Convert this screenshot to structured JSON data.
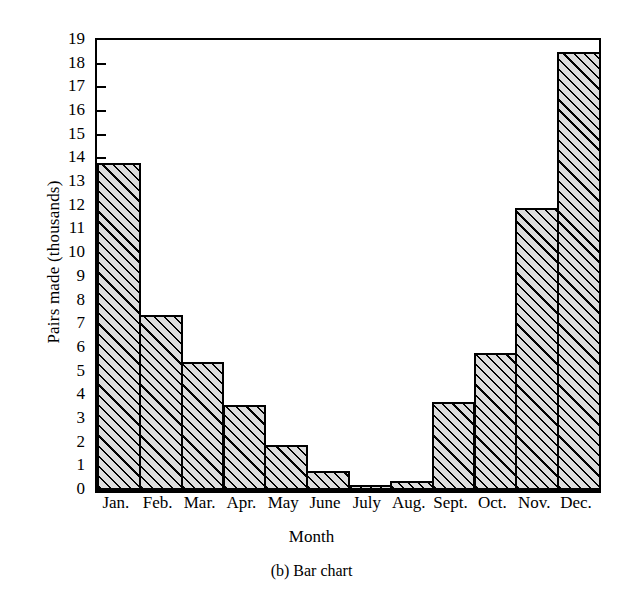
{
  "figure": {
    "caption": "(b)  Bar chart"
  },
  "chart_data": {
    "type": "bar",
    "title": "",
    "xlabel": "Month",
    "ylabel": "Pairs made (thousands)",
    "categories": [
      "Jan.",
      "Feb.",
      "Mar.",
      "Apr.",
      "May",
      "June",
      "July",
      "Aug.",
      "Sept.",
      "Oct.",
      "Nov.",
      "Dec."
    ],
    "values": [
      13.8,
      7.4,
      5.4,
      3.6,
      1.9,
      0.8,
      0.2,
      0.4,
      3.7,
      5.8,
      11.9,
      18.5
    ],
    "ylim": [
      0,
      19
    ],
    "yticks": [
      0,
      1,
      2,
      3,
      4,
      5,
      6,
      7,
      8,
      9,
      10,
      11,
      12,
      13,
      14,
      15,
      16,
      17,
      18,
      19
    ],
    "ytick_labels": [
      "0",
      "1",
      "2",
      "3",
      "4",
      "5",
      "6",
      "7",
      "8",
      "9",
      "10",
      "11",
      "12",
      "13",
      "14",
      "15",
      "16",
      "17",
      "18",
      "19"
    ],
    "grid": false,
    "legend": null,
    "bar_gap": 0,
    "bar_fill": "#dcdcdc",
    "bar_hatch": "diagonal-45",
    "bar_edge_color": "#000000",
    "axis_color": "#000000",
    "background": "#ffffff"
  }
}
